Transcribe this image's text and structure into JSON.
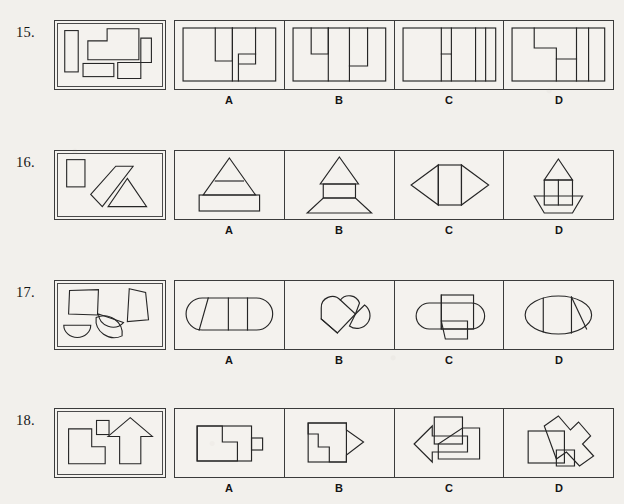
{
  "page": {
    "background_color": "#f2f0ec",
    "ink_color": "#262626",
    "frame_color": "#3b3b3b"
  },
  "option_letters": [
    "A",
    "B",
    "C",
    "D"
  ],
  "questions": [
    {
      "number": "15.",
      "row_top": 18,
      "stem_description": "Four pieces: tall narrow vertical rectangle, large stepped cross-shaped polygon, small wide rectangle, and an L-shaped polygon",
      "options": [
        {
          "letter": "A",
          "description": "Rectangle divided with an L-shaped notch left of center and a small step right of center"
        },
        {
          "letter": "B",
          "description": "Rectangle with an L-notch at upper left and a narrow inverted step at right"
        },
        {
          "letter": "C",
          "description": "Rectangle with a small step shape near center and a narrow vertical strip at right"
        },
        {
          "letter": "D",
          "description": "Rectangle with a Z-shaped step across the middle and a narrow vertical strip at right"
        }
      ]
    },
    {
      "number": "16.",
      "row_top": 148,
      "stem_description": "Three pieces: small upright rectangle, slanted parallelogram strip, and a small triangle",
      "options": [
        {
          "letter": "A",
          "description": "Triangle on top of a horizontal band above a wide rectangle"
        },
        {
          "letter": "B",
          "description": "Triangle above a small rectangle sitting on a wide trapezoid"
        },
        {
          "letter": "C",
          "description": "Rectangle flanked by two triangles pointing left and right, forming a lens"
        },
        {
          "letter": "D",
          "description": "Triangle above a tall divided rectangle resting on a boat-shaped trapezoid"
        }
      ]
    },
    {
      "number": "17.",
      "row_top": 278,
      "stem_description": "Four pieces: square, quadrilateral trapezoid, and two semicircular half-discs",
      "options": [
        {
          "letter": "A",
          "description": "Stadium/capsule shape divided into three parts with a slanted left division"
        },
        {
          "letter": "B",
          "description": "Two overlapping rounded wedges tilted diagonally, like a heart outline"
        },
        {
          "letter": "C",
          "description": "Capsule shape with a rectangle on top and a trapezoid hanging below center"
        },
        {
          "letter": "D",
          "description": "Ellipse divided into three vertical sections with a slanted right division"
        }
      ]
    },
    {
      "number": "18.",
      "row_top": 406,
      "stem_description": "Three pieces: L-shaped polygon, small square, and an upward pointing arrow",
      "options": [
        {
          "letter": "A",
          "description": "Rectangle with an interior L-step and a small square tab on the right edge"
        },
        {
          "letter": "B",
          "description": "Square with a rightward pointing arrow notch cut through it"
        },
        {
          "letter": "C",
          "description": "Leftward pointing arrow with a square above the center and a rectangle at right"
        },
        {
          "letter": "D",
          "description": "Square overlapped by a diagonal arrow pointing to lower right with small square at bottom"
        }
      ]
    }
  ]
}
